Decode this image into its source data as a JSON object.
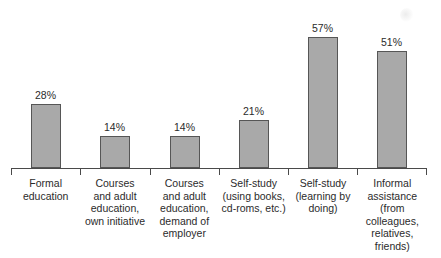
{
  "chart_data": {
    "type": "bar",
    "title": "",
    "subtitle": "",
    "xlabel": "",
    "ylabel": "",
    "ylim": [
      0,
      60
    ],
    "grid": false,
    "legend": "none",
    "value_label_suffix": "%",
    "axis": {
      "baseline_visible": true,
      "tick_count": 7,
      "tick_positions_percent": [
        0,
        16.667,
        33.333,
        50,
        66.667,
        83.333,
        100
      ]
    },
    "categories": [
      "Formal education",
      "Courses and adult education, own initiative",
      "Courses and adult education, demand of employer",
      "Self-study (using books, cd-roms, etc.)",
      "Self-study (learning by doing)",
      "Informal assistance (from colleagues, relatives, friends)"
    ],
    "category_label_lines": [
      [
        "Formal",
        "education"
      ],
      [
        "Courses",
        "and adult",
        "education,",
        "own initiative"
      ],
      [
        "Courses",
        "and adult",
        "education,",
        "demand of",
        "employer"
      ],
      [
        "Self-study",
        "(using books,",
        "cd-roms, etc.)"
      ],
      [
        "Self-study",
        "(learning by",
        "doing)"
      ],
      [
        "Informal",
        "assistance",
        "(from",
        "colleagues,",
        "relatives,",
        "friends)"
      ]
    ],
    "values": [
      28,
      14,
      14,
      21,
      57,
      51
    ],
    "value_labels": [
      "28%",
      "14%",
      "14%",
      "21%",
      "57%",
      "51%"
    ],
    "colors": {
      "bar_fill": "#a9a9a9",
      "bar_border": "#565656",
      "axis": "#4a4a4a",
      "text": "#2b2b2b",
      "background": "#ffffff"
    }
  }
}
